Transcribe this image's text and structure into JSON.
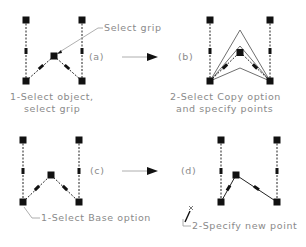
{
  "figure": {
    "panels": [
      {
        "id": "a",
        "tag": "(a)",
        "callout": "Select grip",
        "caption_line1": "1-Select object,",
        "caption_line2": "select grip"
      },
      {
        "id": "b",
        "tag": "(b)",
        "caption_line1": "2-Select Copy option",
        "caption_line2": "and specify points"
      },
      {
        "id": "c",
        "tag": "(c)",
        "callout": "1-Select Base option"
      },
      {
        "id": "d",
        "tag": "(d)",
        "callout": "2-Specify new point"
      }
    ],
    "colors": {
      "grip": "#111111",
      "text": "#8a8a8a",
      "line": "#6f6f6f"
    }
  }
}
